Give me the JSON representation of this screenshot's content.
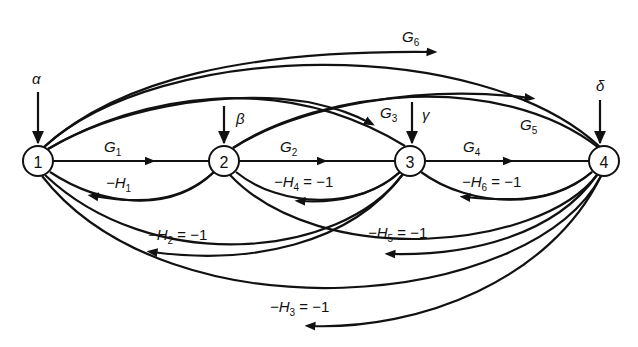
{
  "diagram": {
    "type": "signal-flow-graph",
    "nodes": [
      {
        "id": "1",
        "label": "1",
        "x": 38,
        "y": 161
      },
      {
        "id": "2",
        "label": "2",
        "x": 224,
        "y": 161
      },
      {
        "id": "3",
        "label": "3",
        "x": 410,
        "y": 161
      },
      {
        "id": "4",
        "label": "4",
        "x": 604,
        "y": 161
      }
    ],
    "inputs": [
      {
        "node": "1",
        "symbol": "α"
      },
      {
        "node": "2",
        "symbol": "β"
      },
      {
        "node": "3",
        "symbol": "γ"
      },
      {
        "node": "4",
        "symbol": "δ"
      }
    ],
    "edges": [
      {
        "from": "1",
        "to": "2",
        "gain": "G",
        "sub": "1",
        "suffix": ""
      },
      {
        "from": "2",
        "to": "3",
        "gain": "G",
        "sub": "2",
        "suffix": ""
      },
      {
        "from": "1",
        "to": "3",
        "gain": "G",
        "sub": "3",
        "suffix": ""
      },
      {
        "from": "3",
        "to": "4",
        "gain": "G",
        "sub": "4",
        "suffix": ""
      },
      {
        "from": "2",
        "to": "4",
        "gain": "G",
        "sub": "5",
        "suffix": ""
      },
      {
        "from": "1",
        "to": "4",
        "gain": "G",
        "sub": "6",
        "suffix": ""
      },
      {
        "from": "2",
        "to": "1",
        "gain": "−H",
        "sub": "1",
        "suffix": ""
      },
      {
        "from": "3",
        "to": "1",
        "gain": "−H",
        "sub": "2",
        "suffix": " = −1"
      },
      {
        "from": "4",
        "to": "1",
        "gain": "−H",
        "sub": "3",
        "suffix": " = −1"
      },
      {
        "from": "3",
        "to": "2",
        "gain": "−H",
        "sub": "4",
        "suffix": " = −1"
      },
      {
        "from": "4",
        "to": "2",
        "gain": "−H",
        "sub": "5",
        "suffix": " = −1"
      },
      {
        "from": "4",
        "to": "3",
        "gain": "−H",
        "sub": "6",
        "suffix": " = −1"
      }
    ]
  },
  "labels": {
    "alpha": "α",
    "beta": "β",
    "gamma": "γ",
    "delta": "δ",
    "n1": "1",
    "n2": "2",
    "n3": "3",
    "n4": "4",
    "G": "G",
    "mH": "−H",
    "eq": " = −1",
    "s1": "1",
    "s2": "2",
    "s3": "3",
    "s4": "4",
    "s5": "5",
    "s6": "6"
  }
}
